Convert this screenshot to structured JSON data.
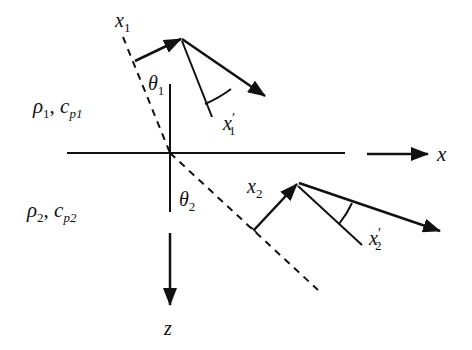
{
  "diagram": {
    "media": [
      {
        "rho": "ρ",
        "rho_sub": "1",
        "sep": ", ",
        "c": "c",
        "c_sub": "p1"
      },
      {
        "rho": "ρ",
        "rho_sub": "2",
        "sep": ", ",
        "c": "c",
        "c_sub": "p2"
      }
    ],
    "angles": [
      {
        "sym": "θ",
        "sub": "1"
      },
      {
        "sym": "θ",
        "sub": "2"
      }
    ],
    "vectors": [
      {
        "sym": "x",
        "sub": "1",
        "prime": ""
      },
      {
        "sym": "x",
        "sub": "1",
        "prime": "′"
      },
      {
        "sym": "x",
        "sub": "2",
        "prime": ""
      },
      {
        "sym": "x",
        "sub": "2",
        "prime": "′"
      }
    ],
    "axes": {
      "x_label": "x",
      "z_label": "z"
    },
    "colors": {
      "line": "#111111",
      "background": "#ffffff"
    }
  }
}
